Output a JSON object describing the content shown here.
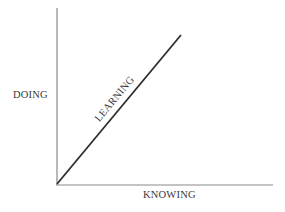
{
  "diagram": {
    "y_axis_label": "DOING",
    "x_axis_label": "KNOWING",
    "line_label": "LEARNING",
    "colors": {
      "axis": "#8a8a8a",
      "line": "#2e2e2e",
      "text": "#3a3a3a",
      "background": "#ffffff"
    }
  }
}
